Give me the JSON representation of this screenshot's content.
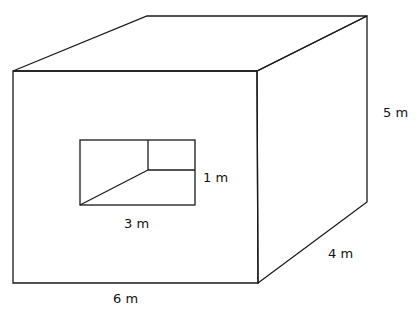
{
  "diagram": {
    "type": "3d-box-with-rectangular-hole",
    "labels": {
      "height": "5 m",
      "depth": "4 m",
      "width": "6 m",
      "hole_width": "3 m",
      "hole_height": "1 m"
    },
    "colors": {
      "line": "#1a1a1a",
      "background": "#ffffff"
    }
  }
}
